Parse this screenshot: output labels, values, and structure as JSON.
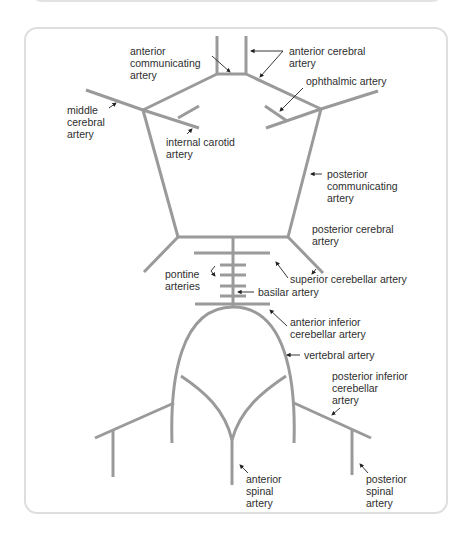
{
  "diagram": {
    "colors": {
      "vessel": "#9a9a9a",
      "leader": "#222222",
      "text": "#2e2e2e",
      "panel_border": "#dedede"
    },
    "labels": {
      "anterior_communicating": [
        "anterior",
        "communicating",
        "artery"
      ],
      "anterior_cerebral": [
        "anterior cerebral",
        "artery"
      ],
      "ophthalmic": [
        "ophthalmic artery"
      ],
      "middle_cerebral": [
        "middle",
        "cerebral",
        "artery"
      ],
      "internal_carotid": [
        "internal carotid",
        "artery"
      ],
      "posterior_communicating": [
        "posterior",
        "communicating",
        "artery"
      ],
      "posterior_cerebral": [
        "posterior cerebral",
        "artery"
      ],
      "superior_cerebellar": [
        "superior cerebellar artery"
      ],
      "pontine": [
        "pontine",
        "arteries"
      ],
      "basilar": [
        "basilar artery"
      ],
      "anterior_inferior_cerebellar": [
        "anterior inferior",
        "cerebellar artery"
      ],
      "vertebral": [
        "vertebral artery"
      ],
      "posterior_inferior_cerebellar": [
        "posterior inferior",
        "cerebellar",
        "artery"
      ],
      "anterior_spinal": [
        "anterior",
        "spinal",
        "artery"
      ],
      "posterior_spinal": [
        "posterior",
        "spinal",
        "artery"
      ]
    }
  }
}
